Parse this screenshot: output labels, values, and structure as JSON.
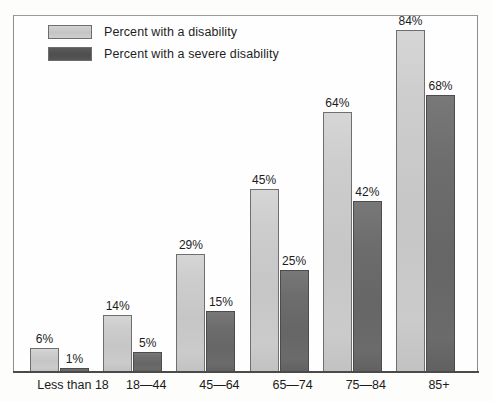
{
  "chart_data": {
    "type": "bar",
    "title": "",
    "subtitle": "",
    "xlabel": "",
    "ylabel": "",
    "ylim": [
      0,
      100
    ],
    "grid": false,
    "legend_position": "top-left",
    "categories": [
      "Less than 18",
      "18—44",
      "45—64",
      "65—74",
      "75—84",
      "85+"
    ],
    "series": [
      {
        "name": "Percent with a disability",
        "color": "#c8c8c8",
        "values": [
          6,
          14,
          29,
          45,
          64,
          84
        ],
        "labels": [
          "6%",
          "14%",
          "29%",
          "45%",
          "64%",
          "84%"
        ]
      },
      {
        "name": "Percent with a severe disability",
        "color": "#6b6b6b",
        "values": [
          1,
          5,
          15,
          25,
          42,
          68
        ],
        "labels": [
          "1%",
          "5%",
          "15%",
          "25%",
          "42%",
          "68%"
        ]
      }
    ]
  },
  "legend": {
    "items": [
      {
        "label": "Percent with a disability",
        "swatch": "light"
      },
      {
        "label": "Percent with a severe disability",
        "swatch": "dark"
      }
    ]
  },
  "colors": {
    "series_light": "#c8c8c8",
    "series_dark": "#6b6b6b",
    "frame": "#8e8e8e",
    "axis": "#4a4a4a",
    "text": "#1b1b1b",
    "background": "#fdfdfc"
  }
}
